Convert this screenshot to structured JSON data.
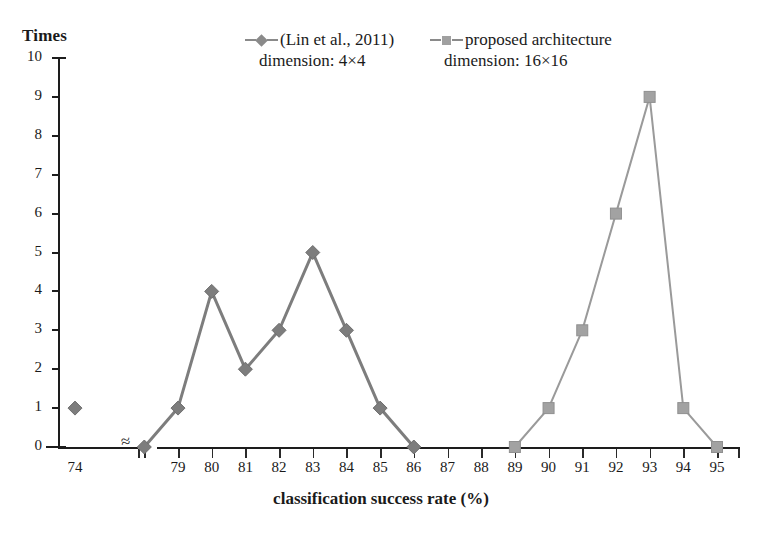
{
  "chart_data": {
    "type": "line",
    "title": "",
    "ylabel": "Times",
    "xlabel": "classification success rate (%)",
    "ylim": [
      0,
      10
    ],
    "yticks": [
      0,
      1,
      2,
      3,
      4,
      5,
      6,
      7,
      8,
      9,
      10
    ],
    "xticks": [
      74,
      79,
      80,
      81,
      82,
      83,
      84,
      85,
      86,
      87,
      88,
      89,
      90,
      91,
      92,
      93,
      94,
      95
    ],
    "xlim": [
      73,
      96
    ],
    "axis_break": {
      "symbol": "≈",
      "between": [
        74,
        78
      ]
    },
    "grid": false,
    "legend_position": "top",
    "series": [
      {
        "name": "(Lin et al., 2011)",
        "sublabel": "dimension: 4×4",
        "marker": "diamond",
        "color": "#7d7d7d",
        "points": [
          {
            "x": 74,
            "y": 1,
            "isolated": true
          },
          {
            "x": 78,
            "y": 0
          },
          {
            "x": 79,
            "y": 1
          },
          {
            "x": 80,
            "y": 4
          },
          {
            "x": 81,
            "y": 2
          },
          {
            "x": 82,
            "y": 3
          },
          {
            "x": 83,
            "y": 5
          },
          {
            "x": 84,
            "y": 3
          },
          {
            "x": 85,
            "y": 1
          },
          {
            "x": 86,
            "y": 0
          }
        ]
      },
      {
        "name": "proposed architecture",
        "sublabel": "dimension: 16×16",
        "marker": "square",
        "color": "#a2a2a2",
        "points": [
          {
            "x": 89,
            "y": 0
          },
          {
            "x": 90,
            "y": 1
          },
          {
            "x": 91,
            "y": 3
          },
          {
            "x": 92,
            "y": 6
          },
          {
            "x": 93,
            "y": 9
          },
          {
            "x": 94,
            "y": 1
          },
          {
            "x": 95,
            "y": 0
          }
        ]
      }
    ]
  },
  "legend": {
    "entries": [
      {
        "label": "(Lin et al., 2011)",
        "sublabel": "dimension: 4×4",
        "marker": "diamond"
      },
      {
        "label": "proposed architecture",
        "sublabel": "dimension: 16×16",
        "marker": "square"
      }
    ]
  },
  "axis": {
    "y_title": "Times",
    "x_title": "classification success rate (%)",
    "break_symbol": "≈"
  },
  "colors": {
    "series1": "#7d7d7d",
    "series2": "#a2a2a2",
    "axis": "#1d1d1d",
    "background": "#ffffff"
  }
}
